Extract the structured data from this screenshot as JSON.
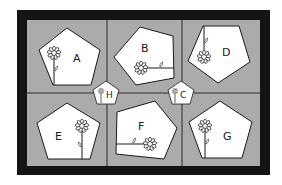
{
  "puzzle": {
    "type": "pentagon-flower-orientation-puzzle",
    "colors": {
      "frame": "#141414",
      "panel": "#ababab",
      "divider": "#2a2a2a",
      "shape_fill": "#ffffff",
      "shape_stroke": "#1a1a1a",
      "background": "#ffffff"
    },
    "panels": [
      {
        "label": "A",
        "position": "top-left"
      },
      {
        "label": "B",
        "position": "top-middle"
      },
      {
        "label": "D",
        "position": "top-right"
      },
      {
        "label": "E",
        "position": "bottom-left"
      },
      {
        "label": "F",
        "position": "bottom-middle"
      },
      {
        "label": "G",
        "position": "bottom-right"
      }
    ],
    "markers": [
      {
        "label": "H",
        "position": "junction-left"
      },
      {
        "label": "C",
        "position": "junction-right"
      }
    ]
  }
}
